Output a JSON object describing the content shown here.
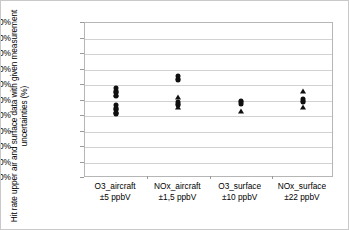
{
  "chart_data": {
    "type": "scatter",
    "title": "",
    "xlabel": "",
    "ylabel": "Hit rate upper air and surface data with given measurement uncertainties (%)",
    "ylim": [
      0,
      100
    ],
    "grid": true,
    "legend": "none",
    "y_ticks": [
      "100%",
      "90%",
      "80%",
      "70%",
      "60%",
      "50%",
      "40%",
      "30%",
      "20%",
      "10%",
      "0%"
    ],
    "y_tick_values": [
      100,
      90,
      80,
      70,
      60,
      50,
      40,
      30,
      20,
      10,
      0
    ],
    "categories": [
      {
        "name": "O3_aircraft",
        "uncertainty": "±5 ppbV"
      },
      {
        "name": "NOx_aircraft",
        "uncertainty": "±1,5 ppbV"
      },
      {
        "name": "O3_surface",
        "uncertainty": "±10 ppbV"
      },
      {
        "name": "NOx_surface",
        "uncertainty": "±22 ppbV"
      }
    ],
    "series": [
      {
        "name": "circle-markers",
        "marker": "circle",
        "points": [
          {
            "category": 0,
            "value": 58
          },
          {
            "category": 0,
            "value": 56
          },
          {
            "category": 0,
            "value": 55
          },
          {
            "category": 0,
            "value": 53
          },
          {
            "category": 0,
            "value": 47
          },
          {
            "category": 0,
            "value": 45
          },
          {
            "category": 0,
            "value": 44
          },
          {
            "category": 0,
            "value": 42
          },
          {
            "category": 0,
            "value": 41
          },
          {
            "category": 1,
            "value": 66
          },
          {
            "category": 1,
            "value": 64
          },
          {
            "category": 1,
            "value": 63
          },
          {
            "category": 1,
            "value": 49
          },
          {
            "category": 1,
            "value": 48
          },
          {
            "category": 1,
            "value": 47
          },
          {
            "category": 2,
            "value": 50
          },
          {
            "category": 2,
            "value": 49
          },
          {
            "category": 2,
            "value": 48
          },
          {
            "category": 3,
            "value": 51
          },
          {
            "category": 3,
            "value": 50
          },
          {
            "category": 3,
            "value": 49
          }
        ]
      },
      {
        "name": "triangle-markers",
        "marker": "triangle",
        "points": [
          {
            "category": 0,
            "value": 57
          },
          {
            "category": 0,
            "value": 54
          },
          {
            "category": 0,
            "value": 46
          },
          {
            "category": 0,
            "value": 43
          },
          {
            "category": 1,
            "value": 52
          },
          {
            "category": 1,
            "value": 46
          },
          {
            "category": 2,
            "value": 43
          },
          {
            "category": 3,
            "value": 56
          },
          {
            "category": 3,
            "value": 46
          }
        ]
      }
    ]
  }
}
